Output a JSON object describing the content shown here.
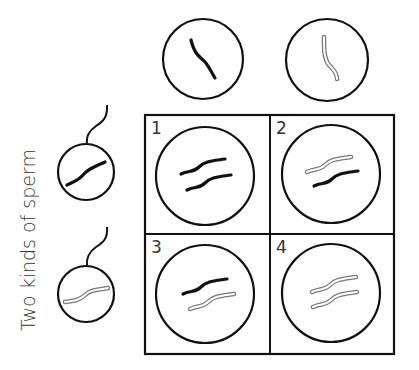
{
  "diagram": {
    "type": "punnett-square",
    "side_label": "Two kinds of sperm",
    "colors": {
      "line": "#111111",
      "dark_chromosome": "#111111",
      "light_chromosome_outline": "#777777",
      "light_chromosome_fill": "#ffffff"
    },
    "eggs": [
      {
        "chromosome": "dark"
      },
      {
        "chromosome": "light"
      }
    ],
    "sperm": [
      {
        "chromosome": "dark"
      },
      {
        "chromosome": "light"
      }
    ],
    "cells": [
      {
        "number": "1",
        "chromosomes": [
          "dark",
          "dark"
        ]
      },
      {
        "number": "2",
        "chromosomes": [
          "light",
          "dark"
        ]
      },
      {
        "number": "3",
        "chromosomes": [
          "dark",
          "light"
        ]
      },
      {
        "number": "4",
        "chromosomes": [
          "light",
          "light"
        ]
      }
    ]
  }
}
